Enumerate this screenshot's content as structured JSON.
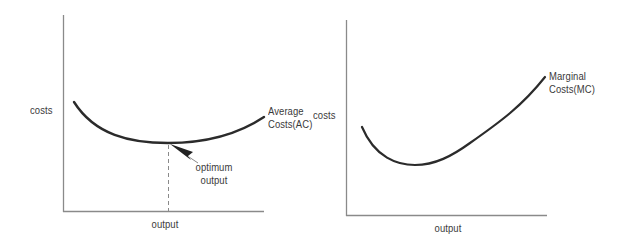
{
  "colors": {
    "axis": "#8a8a8a",
    "curve": "#2b2b2b",
    "text": "#3a3a3a",
    "guide": "#8a8a8a",
    "background": "#ffffff"
  },
  "diagrams": [
    {
      "id": "average-costs",
      "y_axis_label": "costs",
      "x_axis_label": "output",
      "curve_label_line1": "Average",
      "curve_label_line2": "Costs(AC)",
      "annotation_line1": "optimum",
      "annotation_line2": "output",
      "curve_shape": "U-shaped",
      "minimum_marked": true
    },
    {
      "id": "marginal-costs",
      "y_axis_label": "costs",
      "x_axis_label": "output",
      "curve_label_line1": "Marginal",
      "curve_label_line2": "Costs(MC)",
      "curve_shape": "J-shaped (falls then rises steeply)"
    }
  ]
}
